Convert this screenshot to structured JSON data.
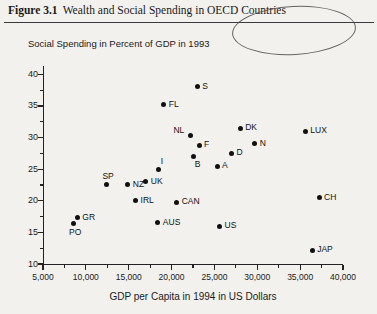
{
  "caption": {
    "figure_number": "Figure 3.1",
    "text": "Wealth and Social Spending in OECD Countries"
  },
  "annotation": {
    "shape": "hand-drawn-ellipse",
    "encircles": "OECD Countries"
  },
  "chart_data": {
    "type": "scatter",
    "title": "Social Spending in Percent of GDP in 1993",
    "xlabel": "GDP per Capita in 1994 in US Dollars",
    "ylabel": "Social Spending in Percent of GDP in 1993",
    "xlim": [
      5000,
      40000
    ],
    "ylim": [
      10,
      41
    ],
    "grid": false,
    "legend": "none",
    "xticks": [
      5000,
      10000,
      15000,
      20000,
      25000,
      30000,
      35000,
      40000
    ],
    "xticklabels": [
      "5,000",
      "10,000",
      "15,000",
      "20,000",
      "25,000",
      "30,000",
      "35,000",
      "40,000"
    ],
    "xminorticks": [
      7500,
      12500,
      17500,
      22500,
      27500,
      32500,
      37500
    ],
    "yticks": [
      10,
      15,
      20,
      25,
      30,
      35,
      40
    ],
    "yticklabels": [
      "10",
      "15",
      "20",
      "25",
      "30",
      "35",
      "40"
    ],
    "yminorticks": [
      12.5,
      17.5,
      22.5,
      27.5,
      32.5,
      37.5
    ],
    "points": [
      {
        "label": "PO",
        "x": 8500,
        "y": 16.4,
        "lp": "below"
      },
      {
        "label": "GR",
        "x": 9000,
        "y": 17.3,
        "lp": "right"
      },
      {
        "label": "SP",
        "x": 12400,
        "y": 22.5,
        "lp": "above"
      },
      {
        "label": "NZ",
        "x": 14900,
        "y": 22.5,
        "lp": "right"
      },
      {
        "label": "IRL",
        "x": 15800,
        "y": 20.0,
        "lp": "right"
      },
      {
        "label": "UK",
        "x": 17000,
        "y": 23.0,
        "lp": "right"
      },
      {
        "label": "AUS",
        "x": 18400,
        "y": 16.5,
        "lp": "right"
      },
      {
        "label": "I",
        "x": 18500,
        "y": 25.0,
        "lp": "above-right"
      },
      {
        "label": "FL",
        "x": 19100,
        "y": 35.2,
        "lp": "right"
      },
      {
        "label": "CAN",
        "x": 20600,
        "y": 19.8,
        "lp": "right"
      },
      {
        "label": "NL",
        "x": 22200,
        "y": 30.3,
        "lp": "above-left"
      },
      {
        "label": "B",
        "x": 22600,
        "y": 27.0,
        "lp": "below-right"
      },
      {
        "label": "S",
        "x": 23000,
        "y": 38.0,
        "lp": "right"
      },
      {
        "label": "F",
        "x": 23200,
        "y": 28.8,
        "lp": "right"
      },
      {
        "label": "A",
        "x": 25300,
        "y": 25.5,
        "lp": "right"
      },
      {
        "label": "US",
        "x": 25600,
        "y": 16.0,
        "lp": "right"
      },
      {
        "label": "D",
        "x": 27000,
        "y": 27.5,
        "lp": "right"
      },
      {
        "label": "DK",
        "x": 28000,
        "y": 31.5,
        "lp": "right"
      },
      {
        "label": "N",
        "x": 29700,
        "y": 29.0,
        "lp": "right"
      },
      {
        "label": "LUX",
        "x": 35600,
        "y": 31.0,
        "lp": "right"
      },
      {
        "label": "CH",
        "x": 37200,
        "y": 20.5,
        "lp": "right"
      },
      {
        "label": "JAP",
        "x": 36400,
        "y": 12.2,
        "lp": "right"
      }
    ]
  }
}
